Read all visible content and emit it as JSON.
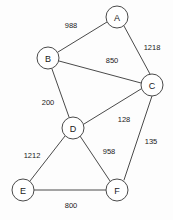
{
  "figure": {
    "kind": "undirected-weighted-graph",
    "background_color": "#fdfdfd",
    "stroke_color": "#4a4a4a",
    "text_color": "#1a1a1a",
    "node_fill": "#ffffff"
  },
  "graph": {
    "nodes": [
      {
        "id": "A",
        "label": "A",
        "cx": 117,
        "cy": 17,
        "r": 11
      },
      {
        "id": "B",
        "label": "B",
        "cx": 48,
        "cy": 58,
        "r": 11
      },
      {
        "id": "C",
        "label": "C",
        "cx": 152,
        "cy": 85,
        "r": 11
      },
      {
        "id": "D",
        "label": "D",
        "cx": 73,
        "cy": 128,
        "r": 11
      },
      {
        "id": "E",
        "label": "E",
        "cx": 23,
        "cy": 190,
        "r": 11
      },
      {
        "id": "F",
        "label": "F",
        "cx": 117,
        "cy": 190,
        "r": 11
      }
    ],
    "edges": [
      {
        "id": "A-B",
        "source": "A",
        "target": "B",
        "weight": "988",
        "x1": 107,
        "y1": 22,
        "x2": 58,
        "y2": 52,
        "lx": 71,
        "ly": 25
      },
      {
        "id": "A-C",
        "source": "A",
        "target": "C",
        "weight": "1218",
        "x1": 124,
        "y1": 26,
        "x2": 150,
        "y2": 74,
        "lx": 152,
        "ly": 47
      },
      {
        "id": "B-C",
        "source": "B",
        "target": "C",
        "weight": "850",
        "x1": 59,
        "y1": 61,
        "x2": 141,
        "y2": 83,
        "lx": 112,
        "ly": 60
      },
      {
        "id": "B-D",
        "source": "B",
        "target": "D",
        "weight": "200",
        "x1": 52,
        "y1": 69,
        "x2": 69,
        "y2": 117,
        "lx": 48,
        "ly": 102
      },
      {
        "id": "C-D",
        "source": "C",
        "target": "D",
        "weight": "128",
        "x1": 141,
        "y1": 89,
        "x2": 84,
        "y2": 124,
        "lx": 124,
        "ly": 119
      },
      {
        "id": "C-F",
        "source": "C",
        "target": "F",
        "weight": "135",
        "x1": 152,
        "y1": 96,
        "x2": 124,
        "y2": 180,
        "lx": 151,
        "ly": 141
      },
      {
        "id": "D-E",
        "source": "D",
        "target": "E",
        "weight": "1212",
        "x1": 65,
        "y1": 136,
        "x2": 30,
        "y2": 181,
        "lx": 32,
        "ly": 155
      },
      {
        "id": "D-F",
        "source": "D",
        "target": "F",
        "weight": "958",
        "x1": 80,
        "y1": 136,
        "x2": 110,
        "y2": 181,
        "lx": 109,
        "ly": 151
      },
      {
        "id": "E-F",
        "source": "E",
        "target": "F",
        "weight": "800",
        "x1": 34,
        "y1": 190,
        "x2": 106,
        "y2": 190,
        "lx": 71,
        "ly": 205
      }
    ]
  }
}
